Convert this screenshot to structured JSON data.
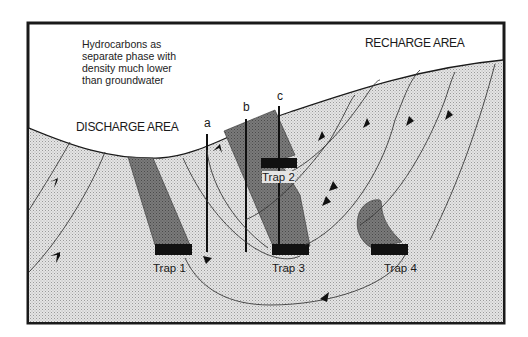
{
  "diagram": {
    "type": "hydrogeologic cross-section",
    "note_lines": [
      "Hydrocarbons as",
      "separate phase with",
      "density much lower",
      "than groundwater"
    ],
    "areas": {
      "recharge": "RECHARGE AREA",
      "discharge": "DISCHARGE AREA"
    },
    "wells": [
      {
        "label": "a"
      },
      {
        "label": "b"
      },
      {
        "label": "c"
      }
    ],
    "traps": [
      {
        "label": "Trap 1"
      },
      {
        "label": "Trap 2"
      },
      {
        "label": "Trap 3"
      },
      {
        "label": "Trap 4"
      }
    ],
    "colors": {
      "subsurface_fill": "#d9d9d9",
      "hydrocarbon_body": "#6f6f6f",
      "trap_cap": "#111111",
      "frame": "#1a1a1a",
      "flow_line": "#3a3a3a"
    }
  }
}
